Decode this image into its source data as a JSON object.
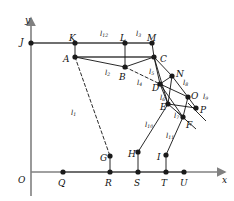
{
  "figure": {
    "kind": "planar-linkage-kinematic-diagram",
    "background": "#ffffff",
    "ink": "#111111",
    "axis_color": "#808080",
    "joint_color": "#1a1a1a",
    "axes": {
      "x_label": "x",
      "y_label": "y",
      "origin_label": "O",
      "x_axis_y": 172,
      "y_axis_x": 31,
      "x_axis_x0": 31,
      "x_axis_x1": 225,
      "y_axis_y0": 18,
      "y_axis_y1": 196
    },
    "joints": [
      {
        "id": "J",
        "label": "J",
        "x": 31,
        "y": 43,
        "lx": 20,
        "ly": 38
      },
      {
        "id": "K",
        "label": "K",
        "x": 75,
        "y": 43,
        "lx": 69,
        "ly": 34
      },
      {
        "id": "L",
        "label": "L",
        "x": 125,
        "y": 43,
        "lx": 120,
        "ly": 34
      },
      {
        "id": "M",
        "label": "M",
        "x": 152,
        "y": 43,
        "lx": 147,
        "ly": 34
      },
      {
        "id": "A",
        "label": "A",
        "x": 75,
        "y": 57,
        "lx": 63,
        "ly": 55
      },
      {
        "id": "B",
        "label": "B",
        "x": 125,
        "y": 67,
        "lx": 119,
        "ly": 73
      },
      {
        "id": "C",
        "label": "C",
        "x": 154,
        "y": 57,
        "lx": 160,
        "ly": 55
      },
      {
        "id": "N",
        "label": "N",
        "x": 172,
        "y": 76,
        "lx": 176,
        "ly": 70
      },
      {
        "id": "D",
        "label": "D",
        "x": 160,
        "y": 84,
        "lx": 152,
        "ly": 84
      },
      {
        "id": "E",
        "label": "E",
        "x": 168,
        "y": 104,
        "lx": 160,
        "ly": 103
      },
      {
        "id": "O",
        "label": "O",
        "x": 188,
        "y": 97,
        "lx": 191,
        "ly": 92
      },
      {
        "id": "P",
        "label": "P",
        "x": 196,
        "y": 108,
        "lx": 200,
        "ly": 106
      },
      {
        "id": "F",
        "label": "F",
        "x": 183,
        "y": 117,
        "lx": 186,
        "ly": 121
      },
      {
        "id": "G",
        "label": "G",
        "x": 110,
        "y": 156,
        "lx": 100,
        "ly": 154
      },
      {
        "id": "H",
        "label": "H",
        "x": 138,
        "y": 152,
        "lx": 128,
        "ly": 150
      },
      {
        "id": "I",
        "label": "I",
        "x": 166,
        "y": 155,
        "lx": 157,
        "ly": 153
      },
      {
        "id": "Q",
        "label": "Q",
        "x": 63,
        "y": 172,
        "lx": 58,
        "ly": 179
      },
      {
        "id": "R",
        "label": "R",
        "x": 110,
        "y": 172,
        "lx": 105,
        "ly": 179
      },
      {
        "id": "S",
        "label": "S",
        "x": 138,
        "y": 172,
        "lx": 134,
        "ly": 179
      },
      {
        "id": "T",
        "label": "T",
        "x": 166,
        "y": 172,
        "lx": 161,
        "ly": 179
      },
      {
        "id": "U",
        "label": "U",
        "x": 184,
        "y": 172,
        "lx": 180,
        "ly": 179
      }
    ],
    "links": [
      {
        "id": "l1",
        "base": "l",
        "sub": "1",
        "from": "A",
        "to": "G",
        "style": "dashed",
        "lx": 71,
        "ly": 110
      },
      {
        "id": "l2",
        "base": "l",
        "sub": "2",
        "from": "A",
        "to": "B",
        "style": "solid",
        "lx": 105,
        "ly": 70
      },
      {
        "id": "l3",
        "base": "l",
        "sub": "3",
        "from": "L",
        "to": "B",
        "style": "solid",
        "lx": 136,
        "ly": 31
      },
      {
        "id": "l4",
        "base": "l",
        "sub": "4",
        "from": "B",
        "to": "D",
        "style": "dashed",
        "lx": 137,
        "ly": 80
      },
      {
        "id": "l5",
        "base": "l",
        "sub": "5",
        "from": "C",
        "to": "D",
        "style": "solid",
        "lx": 149,
        "ly": 69
      },
      {
        "id": "l6",
        "base": "l",
        "sub": "6",
        "from": "D",
        "to": "E",
        "style": "solid",
        "lx": 160,
        "ly": 95
      },
      {
        "id": "l7",
        "base": "l",
        "sub": "7",
        "from": "E",
        "to": "F",
        "style": "solid",
        "lx": 174,
        "ly": 113
      },
      {
        "id": "l8",
        "base": "l",
        "sub": "8",
        "from": "N",
        "to": "O",
        "style": "solid",
        "lx": 183,
        "ly": 80
      },
      {
        "id": "l9",
        "base": "l",
        "sub": "9",
        "from": "O",
        "to": "P",
        "style": "solid",
        "lx": 203,
        "ly": 94
      },
      {
        "id": "l10",
        "base": "l",
        "sub": "10",
        "from": "E",
        "to": "H",
        "style": "solid",
        "lx": 145,
        "ly": 122
      },
      {
        "id": "l11",
        "base": "l",
        "sub": "11",
        "from": "F",
        "to": "I",
        "style": "solid",
        "lx": 166,
        "ly": 133
      },
      {
        "id": "l12",
        "base": "l",
        "sub": "12",
        "from": "K",
        "to": "A",
        "style": "solid",
        "lx": 100,
        "ly": 31
      }
    ],
    "edges": [
      {
        "from": "J",
        "to": "M",
        "style": "solid",
        "weight": "frame"
      },
      {
        "from": "A",
        "to": "C",
        "style": "solid",
        "weight": "frame"
      },
      {
        "from": "K",
        "to": "A",
        "style": "solid",
        "weight": "thin"
      },
      {
        "from": "L",
        "to": "B",
        "style": "solid",
        "weight": "thin"
      },
      {
        "from": "M",
        "to": "C",
        "style": "solid",
        "weight": "thin"
      },
      {
        "from": "A",
        "to": "B",
        "style": "solid",
        "weight": "thin"
      },
      {
        "from": "B",
        "to": "C",
        "style": "solid",
        "weight": "thin"
      },
      {
        "from": "B",
        "to": "D",
        "style": "dashed",
        "weight": "thin"
      },
      {
        "from": "A",
        "to": "G",
        "style": "dashed",
        "weight": "thin"
      },
      {
        "from": "C",
        "to": "D",
        "style": "solid",
        "weight": "thin"
      },
      {
        "from": "C",
        "to": "N",
        "style": "solid",
        "weight": "thin"
      },
      {
        "from": "C",
        "to": "E",
        "style": "solid",
        "weight": "thin"
      },
      {
        "from": "D",
        "to": "N",
        "style": "solid",
        "weight": "thin"
      },
      {
        "from": "D",
        "to": "E",
        "style": "solid",
        "weight": "thin"
      },
      {
        "from": "D",
        "to": "O",
        "style": "solid",
        "weight": "thin"
      },
      {
        "from": "D",
        "to": "F",
        "style": "solid",
        "weight": "thin"
      },
      {
        "from": "N",
        "to": "O",
        "style": "solid",
        "weight": "thin"
      },
      {
        "from": "N",
        "to": "E",
        "style": "solid",
        "weight": "thin"
      },
      {
        "from": "O",
        "to": "P",
        "style": "solid",
        "weight": "thin"
      },
      {
        "from": "O",
        "to": "F",
        "style": "solid",
        "weight": "thin"
      },
      {
        "from": "E",
        "to": "P",
        "style": "solid",
        "weight": "thin"
      },
      {
        "from": "E",
        "to": "F",
        "style": "solid",
        "weight": "thin"
      },
      {
        "from": "E",
        "to": "H",
        "style": "solid",
        "weight": "thin"
      },
      {
        "from": "F",
        "to": "I",
        "style": "solid",
        "weight": "thin"
      },
      {
        "from": "G",
        "to": "R",
        "style": "solid",
        "weight": "thin"
      },
      {
        "from": "H",
        "to": "S",
        "style": "solid",
        "weight": "thin"
      },
      {
        "from": "I",
        "to": "T",
        "style": "solid",
        "weight": "thin"
      },
      {
        "from": "Q",
        "to": "U",
        "style": "solid",
        "weight": "frame"
      }
    ],
    "free_strokes": [
      {
        "name": "slider-p-guide",
        "x1": 188,
        "y1": 103,
        "x2": 206,
        "y2": 121
      },
      {
        "name": "slider-f-guide",
        "x1": 177,
        "y1": 112,
        "x2": 196,
        "y2": 129
      }
    ]
  }
}
